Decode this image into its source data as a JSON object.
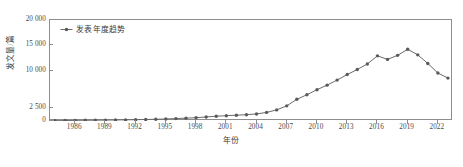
{
  "chart_data": {
    "type": "line",
    "title": "",
    "xlabel": "年份",
    "ylabel": "发文量/篇",
    "legend": [
      "发表年度趋势"
    ],
    "legend_position": "top-left-inside",
    "grid": false,
    "xlim": [
      1983.5,
      2023.5
    ],
    "ylim": [
      0,
      20000
    ],
    "yticks": [
      0,
      2500,
      10000,
      15000,
      20000
    ],
    "ytick_labels": [
      "0",
      "2 500",
      "10 000",
      "15 000",
      "20 000"
    ],
    "xticks": [
      1986,
      1989,
      1992,
      1995,
      1998,
      2001,
      2004,
      2007,
      2010,
      2013,
      2016,
      2019,
      2022
    ],
    "xtick_labels": [
      "1986",
      "1989",
      "1992",
      "1995",
      "1998",
      "2001",
      "2004",
      "2007",
      "2010",
      "2013",
      "2016",
      "2019",
      "2022"
    ],
    "marker": "circle",
    "line_color": "#6b6b6b",
    "marker_color": "#5a5a5a",
    "x": [
      1984,
      1985,
      1986,
      1987,
      1988,
      1989,
      1990,
      1991,
      1992,
      1993,
      1994,
      1995,
      1996,
      1997,
      1998,
      1999,
      2000,
      2001,
      2002,
      2003,
      2004,
      2005,
      2006,
      2007,
      2008,
      2009,
      2010,
      2011,
      2012,
      2013,
      2014,
      2015,
      2016,
      2017,
      2018,
      2019,
      2020,
      2021,
      2022,
      2023
    ],
    "values": [
      60,
      90,
      120,
      140,
      160,
      180,
      200,
      230,
      260,
      300,
      340,
      400,
      480,
      560,
      650,
      800,
      950,
      1050,
      1150,
      1250,
      1400,
      1700,
      2200,
      3000,
      4300,
      5200,
      6200,
      7100,
      8100,
      9200,
      10200,
      11300,
      12900,
      12200,
      13000,
      14200,
      13100,
      11400,
      9500,
      8500
    ],
    "series": [
      {
        "name": "发表年度趋势",
        "values": [
          60,
          90,
          120,
          140,
          160,
          180,
          200,
          230,
          260,
          300,
          340,
          400,
          480,
          560,
          650,
          800,
          950,
          1050,
          1150,
          1250,
          1400,
          1700,
          2200,
          3000,
          4300,
          5200,
          6200,
          7100,
          8100,
          9200,
          10200,
          11300,
          12900,
          12200,
          13000,
          14200,
          13100,
          11400,
          9500,
          8500
        ]
      }
    ]
  },
  "figure": {
    "frame_color": "#8d8d8d",
    "background": "#ffffff"
  }
}
